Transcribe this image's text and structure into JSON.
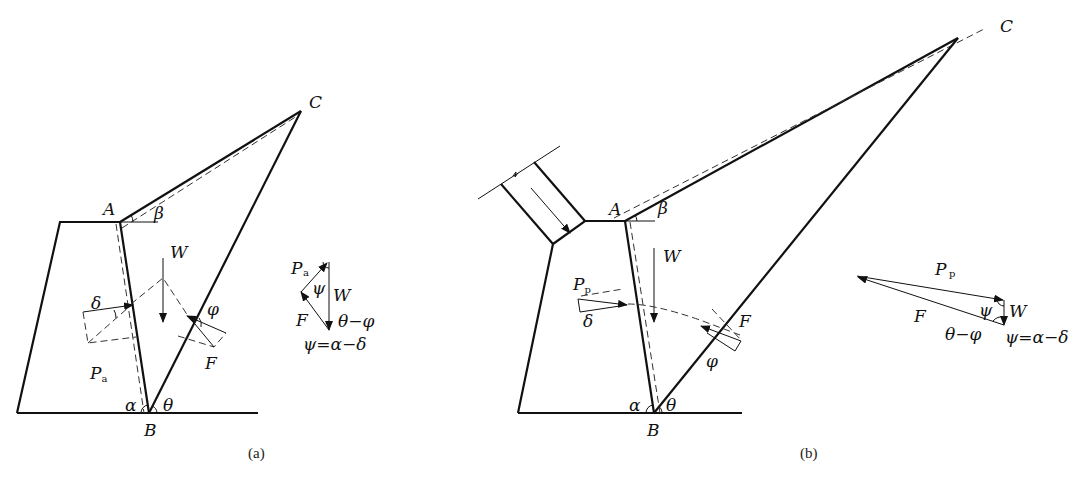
{
  "figure_a": {
    "caption": "(a)",
    "points": {
      "A": "A",
      "B": "B",
      "C": "C"
    },
    "angles": {
      "alpha": "α",
      "beta": "β",
      "theta": "θ",
      "delta": "δ",
      "phi": "φ",
      "psi": "ψ"
    },
    "forces": {
      "W": "W",
      "F": "F",
      "P": "P",
      "P_sub": "a"
    },
    "force_triangle": {
      "P": "P",
      "P_sub": "a",
      "W": "W",
      "F": "F",
      "psi": "ψ",
      "theta_minus_phi": "θ−φ",
      "relation": "ψ=α−δ"
    }
  },
  "figure_b": {
    "caption": "(b)",
    "points": {
      "A": "A",
      "B": "B",
      "C": "C"
    },
    "angles": {
      "alpha": "α",
      "beta": "β",
      "theta": "θ",
      "delta": "δ",
      "phi": "φ",
      "psi": "ψ"
    },
    "forces": {
      "W": "W",
      "F": "F",
      "P": "P",
      "P_sub": "p"
    },
    "force_triangle": {
      "P": "P",
      "P_sub": "p",
      "W": "W",
      "F": "F",
      "psi": "ψ",
      "theta_minus_phi": "θ−φ",
      "relation": "ψ=α−δ"
    }
  }
}
